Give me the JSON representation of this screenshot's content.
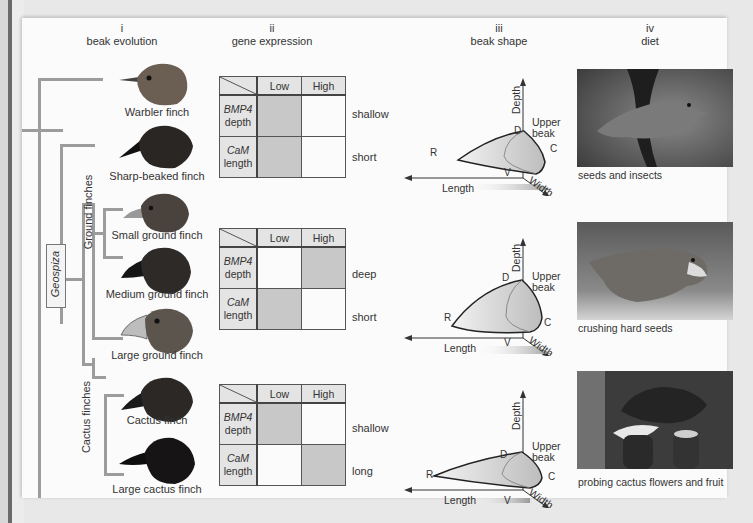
{
  "columns": [
    {
      "numeral": "i",
      "title": "beak evolution"
    },
    {
      "numeral": "ii",
      "title": "gene expression"
    },
    {
      "numeral": "iii",
      "title": "beak shape"
    },
    {
      "numeral": "iv",
      "title": "diet"
    }
  ],
  "tree": {
    "genus_label": "Geospiza",
    "clade_labels": [
      "Ground finches",
      "Cactus finches"
    ]
  },
  "finches": [
    {
      "name": "Warbler finch",
      "shade": "#6b5e52"
    },
    {
      "name": "Sharp-beaked finch",
      "shade": "#2a2624"
    },
    {
      "name": "Small ground finch",
      "shade": "#4a423c"
    },
    {
      "name": "Medium ground finch",
      "shade": "#2e2a28"
    },
    {
      "name": "Large ground finch",
      "shade": "#5c554e"
    },
    {
      "name": "Cactus finch",
      "shade": "#2c2826"
    },
    {
      "name": "Large cactus finch",
      "shade": "#161414"
    }
  ],
  "gene_tables": [
    {
      "headers": [
        "Low",
        "High"
      ],
      "rows": [
        {
          "gene": "BMP4",
          "trait": "depth",
          "expression": "Low",
          "outcome": "shallow"
        },
        {
          "gene": "CaM",
          "trait": "length",
          "expression": "Low",
          "outcome": "short"
        }
      ]
    },
    {
      "headers": [
        "Low",
        "High"
      ],
      "rows": [
        {
          "gene": "BMP4",
          "trait": "depth",
          "expression": "High",
          "outcome": "deep"
        },
        {
          "gene": "CaM",
          "trait": "length",
          "expression": "Low",
          "outcome": "short"
        }
      ]
    },
    {
      "headers": [
        "Low",
        "High"
      ],
      "rows": [
        {
          "gene": "BMP4",
          "trait": "depth",
          "expression": "Low",
          "outcome": "shallow"
        },
        {
          "gene": "CaM",
          "trait": "length",
          "expression": "High",
          "outcome": "long"
        }
      ]
    }
  ],
  "beak_shape": {
    "axis_labels": {
      "depth": "Depth",
      "length": "Length",
      "width": "Width"
    },
    "point_labels": {
      "dorsal": "D",
      "rostral": "R",
      "ventral": "V",
      "caudal": "C"
    },
    "upper_beak_label": "Upper beak"
  },
  "diet": [
    {
      "caption": "seeds and insects"
    },
    {
      "caption": "crushing hard seeds"
    },
    {
      "caption": "probing cactus flowers and fruit"
    }
  ],
  "colors": {
    "tree_line": "#9c9c9c",
    "expression_on": "#c8c8c8",
    "panel_bg": "#fbfbfb"
  }
}
